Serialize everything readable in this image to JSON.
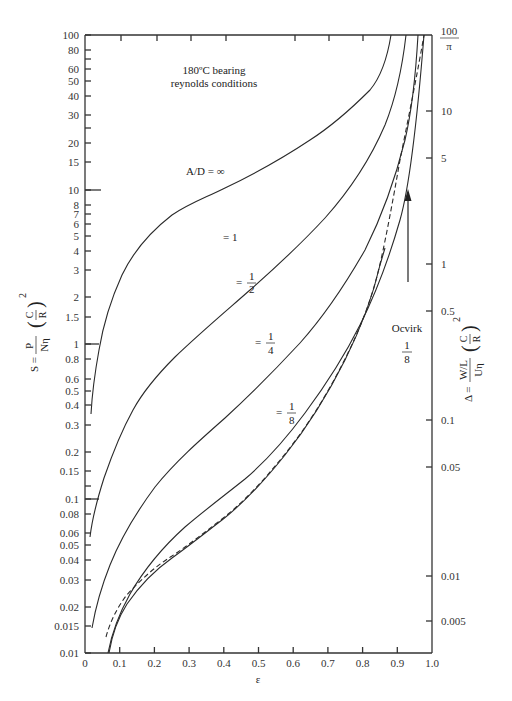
{
  "chart_data": {
    "type": "line",
    "title_lines": [
      "180ºC bearing",
      "reynolds conditions"
    ],
    "xlabel": "ε",
    "ylabel_left": "S = P/(Nη) (C/R)^2",
    "ylabel_right": "Δ = (W/L)/(Uη) (C/R)^2",
    "xlim": [
      0,
      1.0
    ],
    "ylim_left": [
      0.01,
      100
    ],
    "yscale": "log",
    "grid": false,
    "x_ticks": [
      "0",
      "0.1",
      "0.2",
      "0.3",
      "0.4",
      "0.5",
      "0.6",
      "0.7",
      "0.8",
      "0.9",
      "1.0"
    ],
    "y_left_ticks": [
      "100",
      "80",
      "60",
      "50",
      "40",
      "30",
      "20",
      "15",
      "10",
      "8",
      "7",
      "6",
      "5",
      "4",
      "3",
      "2",
      "1.5",
      "1",
      "0.8",
      "0.6",
      "0.5",
      "0.4",
      "0.3",
      "0.2",
      "0.15",
      "0.1",
      "0.08",
      "0.06",
      "0.05",
      "0.04",
      "0.03",
      "0.02",
      "0.015",
      "0.01"
    ],
    "y_right_ticks": [
      "100/π",
      "10",
      "5",
      "1",
      "0.5",
      "0.1",
      "0.05",
      "0.01",
      "0.005"
    ],
    "series": [
      {
        "name": "A/D = ∞",
        "label": "A/D = ∞",
        "style": "solid",
        "x": [
          0.01,
          0.03,
          0.06,
          0.1,
          0.15,
          0.2,
          0.3,
          0.4,
          0.5,
          0.6,
          0.7,
          0.8,
          0.85,
          0.9,
          0.92
        ],
        "y": [
          0.4,
          0.75,
          1.5,
          2.8,
          4.5,
          6.0,
          8.3,
          10.5,
          14,
          19,
          27,
          45,
          60,
          85,
          100
        ]
      },
      {
        "name": "A/D = 1",
        "label": "= 1",
        "style": "solid",
        "x": [
          0.015,
          0.05,
          0.1,
          0.15,
          0.2,
          0.3,
          0.4,
          0.5,
          0.6,
          0.7,
          0.8,
          0.85,
          0.9,
          0.95
        ],
        "y": [
          0.06,
          0.15,
          0.35,
          0.7,
          1.0,
          1.9,
          3.0,
          4.7,
          7.5,
          12,
          22,
          33,
          60,
          100
        ]
      },
      {
        "name": "A/D = 1/2",
        "label": "= 1/2",
        "style": "solid",
        "x": [
          0.02,
          0.05,
          0.1,
          0.2,
          0.3,
          0.4,
          0.5,
          0.6,
          0.7,
          0.8,
          0.85,
          0.9,
          0.95,
          0.96
        ],
        "y": [
          0.015,
          0.03,
          0.07,
          0.2,
          0.4,
          0.75,
          1.3,
          2.2,
          4.0,
          8.5,
          14,
          27,
          80,
          100
        ]
      },
      {
        "name": "A/D = 1/4",
        "label": "= 1/4",
        "style": "solid",
        "x": [
          0.07,
          0.1,
          0.2,
          0.3,
          0.4,
          0.5,
          0.6,
          0.7,
          0.8,
          0.85,
          0.9,
          0.95,
          0.97
        ],
        "y": [
          0.01,
          0.02,
          0.06,
          0.12,
          0.21,
          0.37,
          0.65,
          1.2,
          2.6,
          4.5,
          9.5,
          40,
          100
        ]
      },
      {
        "name": "A/D = 1/8",
        "label": "= 1/8",
        "style": "solid",
        "x": [
          0.07,
          0.1,
          0.2,
          0.3,
          0.4,
          0.5,
          0.6,
          0.7,
          0.8,
          0.85,
          0.9,
          0.93
        ],
        "y": [
          0.01,
          0.014,
          0.021,
          0.032,
          0.05,
          0.08,
          0.13,
          0.23,
          0.5,
          0.85,
          1.8,
          3.5
        ]
      },
      {
        "name": "Ocvirk 1/8",
        "label": "Ocvirk 1/8",
        "style": "dashed",
        "x": [
          0.065,
          0.1,
          0.2,
          0.3,
          0.4,
          0.5,
          0.6,
          0.7,
          0.8,
          0.9,
          0.93,
          0.95,
          0.97,
          0.98
        ],
        "y": [
          0.012,
          0.016,
          0.023,
          0.033,
          0.05,
          0.08,
          0.13,
          0.23,
          0.5,
          1.6,
          3.0,
          6.5,
          25,
          100
        ]
      }
    ],
    "annotations": [
      {
        "text": "A/D = ∞",
        "x": 0.38,
        "y": 10.5
      },
      {
        "text": "= 1",
        "x": 0.4,
        "y": 4.2
      },
      {
        "text": "= 1/2",
        "x": 0.45,
        "y": 2.3
      },
      {
        "text": "= 1/4",
        "x": 0.52,
        "y": 0.75
      },
      {
        "text": "= 1/8",
        "x": 0.58,
        "y": 0.14
      },
      {
        "text": "Ocvirk 1/8",
        "x": 0.94,
        "y": 0.5,
        "arrow_to": {
          "x": 0.94,
          "y": 3.4
        }
      }
    ]
  },
  "labels": {
    "title_line1": "180ºC bearing",
    "title_line2": "reynolds conditions",
    "xlabel": "ε",
    "ann_inf": "A/D = ∞",
    "ann_1": "= 1",
    "ann_half_eq": "=",
    "ann_half_num": "1",
    "ann_half_den": "2",
    "ann_quarter_eq": "=",
    "ann_quarter_num": "1",
    "ann_quarter_den": "4",
    "ann_eighth_eq": "=",
    "ann_eighth_num": "1",
    "ann_eighth_den": "8",
    "ocvirk": "Ocvirk",
    "ocvirk_num": "1",
    "ocvirk_den": "8",
    "right_top_num": "100",
    "right_top_den": "π",
    "left_S": "S =",
    "left_P": "P",
    "left_Neta": "Nη",
    "left_C": "C",
    "left_R": "R",
    "exp2": "2",
    "right_Delta": "Δ =",
    "right_WL": "W/L",
    "right_Ueta": "Uη",
    "right_C": "C",
    "right_R": "R"
  },
  "ticks": {
    "x": [
      {
        "label": "0",
        "px": 85
      },
      {
        "label": "0.1",
        "px": 119.7
      },
      {
        "label": "0.2",
        "px": 154.4
      },
      {
        "label": "0.3",
        "px": 189.1
      },
      {
        "label": "0.4",
        "px": 223.8
      },
      {
        "label": "0.5",
        "px": 258.5
      },
      {
        "label": "0.6",
        "px": 293.2
      },
      {
        "label": "0.7",
        "px": 327.9
      },
      {
        "label": "0.8",
        "px": 362.6
      },
      {
        "label": "0.9",
        "px": 397.3
      },
      {
        "label": "1.0",
        "px": 432
      }
    ],
    "yl": [
      {
        "label": "100",
        "py": 35
      },
      {
        "label": "80",
        "py": 50
      },
      {
        "label": "",
        "py": 59
      },
      {
        "label": "60",
        "py": 69
      },
      {
        "label": "50",
        "py": 81
      },
      {
        "label": "40",
        "py": 96
      },
      {
        "label": "30",
        "py": 115
      },
      {
        "label": "",
        "py": 128
      },
      {
        "label": "20",
        "py": 143
      },
      {
        "label": "15",
        "py": 162
      },
      {
        "label": "10",
        "py": 190
      },
      {
        "label": "8",
        "py": 205
      },
      {
        "label": "7",
        "py": 214
      },
      {
        "label": "6",
        "py": 224
      },
      {
        "label": "5",
        "py": 236
      },
      {
        "label": "4",
        "py": 251
      },
      {
        "label": "3",
        "py": 270
      },
      {
        "label": "2",
        "py": 297
      },
      {
        "label": "1.5",
        "py": 317
      },
      {
        "label": "1",
        "py": 344
      },
      {
        "label": "0.8",
        "py": 359
      },
      {
        "label": "0.6",
        "py": 379
      },
      {
        "label": "0.5",
        "py": 391
      },
      {
        "label": "0.4",
        "py": 405
      },
      {
        "label": "0.3",
        "py": 425
      },
      {
        "label": "0.2",
        "py": 452
      },
      {
        "label": "0.15",
        "py": 471
      },
      {
        "label": "",
        "py": 486
      },
      {
        "label": "0.1",
        "py": 499
      },
      {
        "label": "0.08",
        "py": 514
      },
      {
        "label": "0.06",
        "py": 533
      },
      {
        "label": "0.05",
        "py": 545
      },
      {
        "label": "0.04",
        "py": 560
      },
      {
        "label": "0.03",
        "py": 580
      },
      {
        "label": "0.02",
        "py": 607
      },
      {
        "label": "0.015",
        "py": 626
      },
      {
        "label": "0.01",
        "py": 653
      }
    ],
    "yr": [
      {
        "label": "10",
        "py": 111
      },
      {
        "label": "5",
        "py": 158
      },
      {
        "label": "1",
        "py": 264
      },
      {
        "label": "0.5",
        "py": 311
      },
      {
        "label": "0.1",
        "py": 420
      },
      {
        "label": "0.05",
        "py": 467
      },
      {
        "label": "0.01",
        "py": 576
      },
      {
        "label": "0.005",
        "py": 621
      }
    ]
  }
}
